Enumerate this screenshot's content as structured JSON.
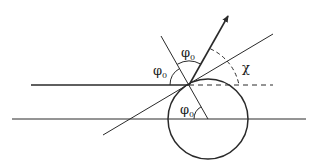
{
  "diagram": {
    "labels": {
      "phi_top": "φ",
      "phi_top_sub": "0",
      "phi_left": "φ",
      "phi_left_sub": "0",
      "phi_bottom": "φ",
      "phi_bottom_sub": "0",
      "chi": "χ"
    },
    "colors": {
      "stroke": "#2a2a2a",
      "background": "#ffffff"
    },
    "elements": [
      "incoming-horizontal-line",
      "reference-horizontal-line",
      "circle-sphere",
      "normal-line",
      "tangent-line",
      "scattered-direction-arrow",
      "dashed-horizontal-extension",
      "angle-arc-phi0-top",
      "angle-arc-phi0-left",
      "angle-arc-phi0-bottom",
      "angle-arc-chi-dashed"
    ]
  }
}
